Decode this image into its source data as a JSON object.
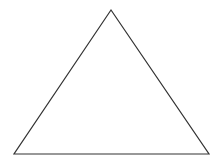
{
  "diagram": {
    "shape": "triangle",
    "type": "equilateral-like",
    "stroke_color": "#333333",
    "fill_color": "#ffffff",
    "background_color": "#ffffff",
    "stroke_width": 1.2,
    "vertices": {
      "apex": [
        111,
        10
      ],
      "bottom_left": [
        14,
        154
      ],
      "bottom_right": [
        209,
        154
      ]
    }
  }
}
